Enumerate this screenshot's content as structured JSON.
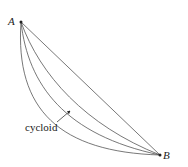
{
  "diagram": {
    "points": {
      "A": {
        "label": "A",
        "x": 21,
        "y": 22
      },
      "B": {
        "label": "B",
        "x": 160,
        "y": 155
      }
    },
    "curves": [
      {
        "name": "straight-line",
        "path": "M21,22 L160,155"
      },
      {
        "name": "shallow-curve",
        "path": "M21,22 Q70,110 160,155"
      },
      {
        "name": "cycloid",
        "path": "M21,22 C30,90 70,135 160,155"
      },
      {
        "name": "steep-curve",
        "path": "M21,22 C18,110 70,150 160,155"
      }
    ],
    "annotation": {
      "text": "cycloid",
      "arrow_from": {
        "x": 57,
        "y": 122
      },
      "arrow_to": {
        "x": 71,
        "y": 110
      }
    },
    "colors": {
      "stroke": "#555555",
      "text": "#222222"
    }
  }
}
